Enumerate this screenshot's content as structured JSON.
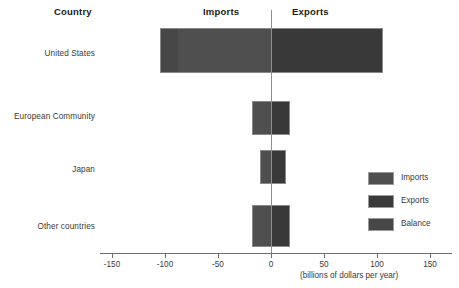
{
  "header": {
    "country": "Country",
    "imports": "Imports",
    "exports": "Exports"
  },
  "axis": {
    "unit_label": "(billions of dollars per year)",
    "ticks": [
      "-150",
      "-100",
      "-50",
      "0",
      "50",
      "100",
      "150"
    ]
  },
  "legend": {
    "items": [
      {
        "label": "Imports",
        "color": "#4f4f4f"
      },
      {
        "label": "Exports",
        "color": "#393939"
      },
      {
        "label": "Balance",
        "color": "#474747"
      }
    ]
  },
  "chart_data": {
    "type": "bar",
    "orientation": "horizontal",
    "title": "",
    "xlabel": "(billions of dollars per year)",
    "ylabel": "Country",
    "xlim": [
      -160,
      165
    ],
    "xticks": [
      -150,
      -100,
      -50,
      0,
      50,
      100,
      150
    ],
    "grid": false,
    "legend_position": "right",
    "categories": [
      "United States",
      "European Community",
      "Japan",
      "Other countries"
    ],
    "series": [
      {
        "name": "Imports",
        "values": [
          -88,
          -18,
          -10,
          -18
        ]
      },
      {
        "name": "Exports",
        "values": [
          105,
          18,
          14,
          18
        ]
      },
      {
        "name": "Balance",
        "values": [
          -17,
          0,
          4,
          0
        ]
      }
    ]
  },
  "bars": [
    {
      "category": "United States",
      "label_lines": [
        "United States"
      ],
      "label_top": 49,
      "row_top": 28,
      "row_height": 45,
      "segments": [
        {
          "type": "balance",
          "x": 160,
          "width": 18
        },
        {
          "type": "imports",
          "x": 178,
          "width": 93
        },
        {
          "type": "exports",
          "x": 271,
          "width": 112
        }
      ]
    },
    {
      "category": "European Community",
      "label_lines": [
        "European Community"
      ],
      "label_top": 112,
      "row_top": 101,
      "row_height": 34,
      "segments": [
        {
          "type": "imports",
          "x": 252,
          "width": 19
        },
        {
          "type": "exports",
          "x": 271,
          "width": 19
        }
      ]
    },
    {
      "category": "Japan",
      "label_lines": [
        "Japan"
      ],
      "label_top": 165,
      "row_top": 150,
      "row_height": 34,
      "segments": [
        {
          "type": "imports",
          "x": 260,
          "width": 11
        },
        {
          "type": "exports",
          "x": 271,
          "width": 15
        }
      ]
    },
    {
      "category": "Other countries",
      "label_lines": [
        "Other countries"
      ],
      "label_top": 222,
      "row_top": 205,
      "row_height": 42,
      "segments": [
        {
          "type": "imports",
          "x": 252,
          "width": 19
        },
        {
          "type": "exports",
          "x": 271,
          "width": 19
        }
      ]
    }
  ]
}
